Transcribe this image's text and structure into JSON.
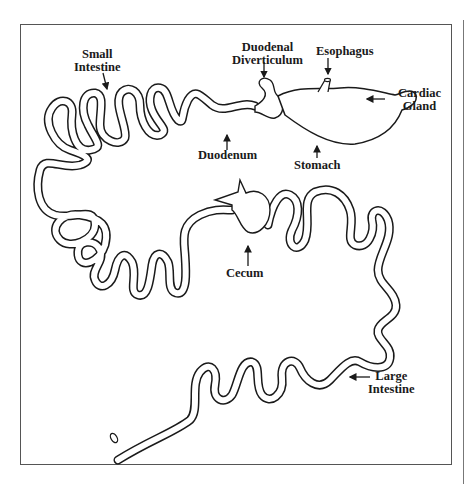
{
  "diagram": {
    "type": "anatomical-line-drawing",
    "labels": {
      "small_intestine": [
        "Small",
        "Intestine"
      ],
      "duodenal_diverticulum": [
        "Duodenal",
        "Diverticulum"
      ],
      "esophagus": [
        "Esophagus"
      ],
      "cardiac_gland": [
        "Cardiac",
        "Gland"
      ],
      "duodenum": [
        "Duodenum"
      ],
      "stomach": [
        "Stomach"
      ],
      "cecum": [
        "Cecum"
      ],
      "large_intestine": [
        "Large",
        "Intestine"
      ]
    },
    "colors": {
      "line": "#1a1a1a",
      "background": "#ffffff",
      "frame": "#555555"
    }
  }
}
